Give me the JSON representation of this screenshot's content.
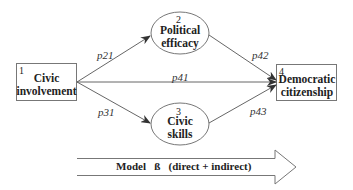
{
  "nodes": [
    {
      "id": "1",
      "number": "1",
      "line1": "Civic",
      "line2": "involvement",
      "shape": "rectangle"
    },
    {
      "id": "2",
      "number": "2",
      "line1": "Political",
      "line2": "efficacy",
      "shape": "ellipse"
    },
    {
      "id": "3",
      "number": "3",
      "line1": "Civic",
      "line2": "skills",
      "shape": "ellipse"
    },
    {
      "id": "4",
      "number": "4",
      "line1": "Democratic",
      "line2": "citizenship",
      "shape": "rectangle"
    }
  ],
  "paths": {
    "p21": "p21",
    "p31": "p31",
    "p41": "p41",
    "p42": "p42",
    "p43": "p43"
  },
  "model_arrow": {
    "label": "Model   ß   (direct + indirect)"
  },
  "colors": {
    "stroke": "#6a6a6a",
    "text": "#222222",
    "background": "#ffffff"
  }
}
